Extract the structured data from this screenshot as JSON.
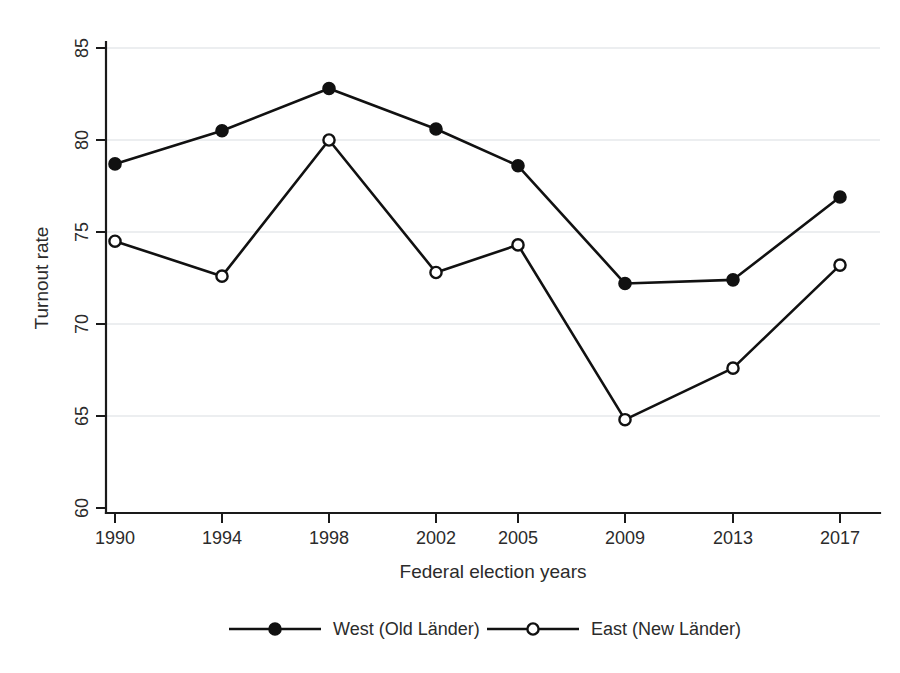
{
  "chart_data": {
    "type": "line",
    "title": "",
    "xlabel": "Federal election years",
    "ylabel": "Turnout rate",
    "categories": [
      "1990",
      "1994",
      "1998",
      "2002",
      "2005",
      "2009",
      "2013",
      "2017"
    ],
    "x": [
      1990,
      1994,
      1998,
      2002,
      2005,
      2009,
      2013,
      2017
    ],
    "xtick_labels": [
      "1990",
      "1994",
      "1998",
      "2002",
      "2005",
      "2009",
      "2013",
      "2017"
    ],
    "ytick_labels": [
      "60",
      "65",
      "70",
      "75",
      "80",
      "85"
    ],
    "yticks": [
      60,
      65,
      70,
      75,
      80,
      85
    ],
    "ylim": [
      58.5,
      86.5
    ],
    "grid": "horizontal",
    "legend_position": "bottom",
    "series": [
      {
        "name": "West (Old Länder)",
        "marker": "filled-circle",
        "color": "#111111",
        "values": [
          78.7,
          80.5,
          82.8,
          80.6,
          78.6,
          72.2,
          72.4,
          76.9
        ]
      },
      {
        "name": "East (New Länder)",
        "marker": "open-circle",
        "color": "#111111",
        "values": [
          74.5,
          72.6,
          80.0,
          72.8,
          74.3,
          64.8,
          67.6,
          73.2
        ]
      }
    ]
  },
  "legend": {
    "entries": [
      {
        "label": "West (Old Länder)",
        "marker": "filled-circle"
      },
      {
        "label": "East (New Länder)",
        "marker": "open-circle"
      }
    ]
  },
  "axes": {
    "y_title": "Turnout rate",
    "x_title": "Federal election years"
  }
}
